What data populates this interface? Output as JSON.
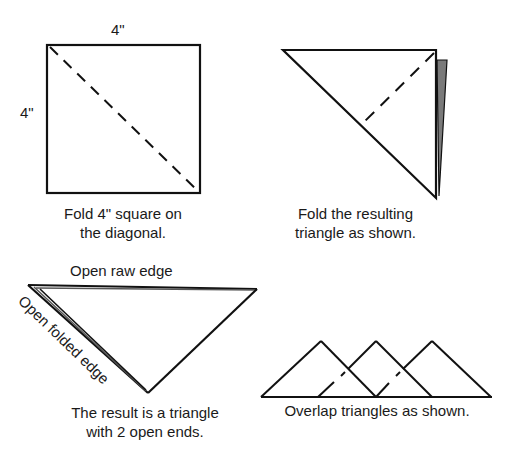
{
  "steps": [
    {
      "id": 1,
      "dimension_top": "4\"",
      "dimension_left": "4\"",
      "caption_line1": "Fold 4\" square on",
      "caption_line2": "the diagonal."
    },
    {
      "id": 2,
      "caption_line1": "Fold the resulting",
      "caption_line2": "triangle as shown."
    },
    {
      "id": 3,
      "label_raw_edge": "Open raw edge",
      "label_folded_edge": "Open folded edge",
      "caption_line1": "The result is a triangle",
      "caption_line2": "with 2 open ends."
    },
    {
      "id": 4,
      "caption": "Overlap triangles as shown."
    }
  ],
  "colors": {
    "line": "#111111",
    "shade": "#7a7a7a",
    "background": "#ffffff"
  }
}
